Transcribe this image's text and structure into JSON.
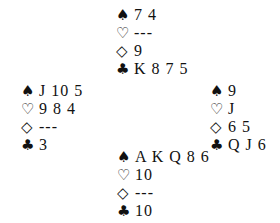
{
  "suits": {
    "spades": "♠",
    "hearts": "♡",
    "diamonds": "◇",
    "clubs": "♣"
  },
  "hands": {
    "north": {
      "spades": "7 4",
      "hearts": "---",
      "diamonds": "9",
      "clubs": "K 8 7 5"
    },
    "west": {
      "spades": "J 10 5",
      "hearts": "9 8 4",
      "diamonds": "---",
      "clubs": "3"
    },
    "east": {
      "spades": "9",
      "hearts": "J",
      "diamonds": "6 5",
      "clubs": "Q J 6"
    },
    "south": {
      "spades": "A K Q 8 6",
      "hearts": "10",
      "diamonds": "---",
      "clubs": "10"
    }
  }
}
